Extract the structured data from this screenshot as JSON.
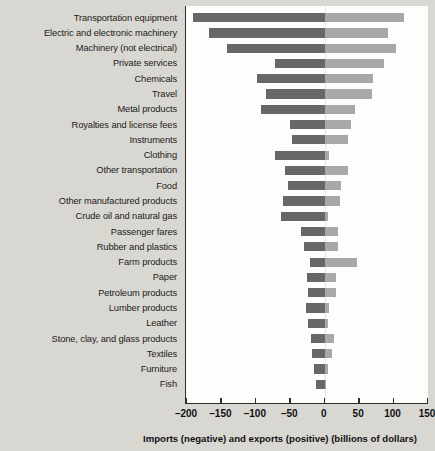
{
  "chart_data": {
    "type": "bar",
    "orientation": "horizontal",
    "title": "",
    "xlabel": "Imports (negative) and exports (positive) (billions of dollars)",
    "ylabel": "",
    "xlim": [
      -200,
      150
    ],
    "xticks": [
      -200,
      -150,
      -100,
      -50,
      0,
      50,
      100,
      150
    ],
    "xtick_labels": [
      "–200",
      "–150",
      "–100",
      "–50",
      "0",
      "50",
      "100",
      "150"
    ],
    "grid": false,
    "legend": "none",
    "colors": {
      "imports": "#676767",
      "exports": "#a8a8a8",
      "background": "#d9d7d2",
      "plot_background": "#fdfdfb",
      "axis": "#2c2c2c"
    },
    "categories": [
      "Transportation equipment",
      "Electric and electronic machinery",
      "Machinery (not electrical)",
      "Private services",
      "Chemicals",
      "Travel",
      "Metal products",
      "Royalties and license fees",
      "Instruments",
      "Clothing",
      "Other transportation",
      "Food",
      "Other manufactured products",
      "Crude oil and natural gas",
      "Passenger fares",
      "Rubber and plastics",
      "Farm products",
      "Paper",
      "Petroleum products",
      "Lumber products",
      "Leather",
      "Stone, clay, and glass products",
      "Textiles",
      "Furniture",
      "Fish"
    ],
    "series": [
      {
        "name": "Imports (negative)",
        "color": "#676767",
        "values": [
          -192,
          -168,
          -142,
          -72,
          -98,
          -85,
          -92,
          -50,
          -48,
          -72,
          -58,
          -53,
          -60,
          -63,
          -35,
          -30,
          -21,
          -26,
          -24,
          -27,
          -25,
          -20,
          -18,
          -16,
          -12
        ]
      },
      {
        "name": "Exports (positive)",
        "color": "#a8a8a8",
        "values": [
          115,
          92,
          103,
          86,
          70,
          68,
          44,
          38,
          34,
          6,
          34,
          24,
          22,
          5,
          20,
          19,
          47,
          17,
          16,
          6,
          5,
          13,
          10,
          5,
          2
        ]
      }
    ]
  }
}
